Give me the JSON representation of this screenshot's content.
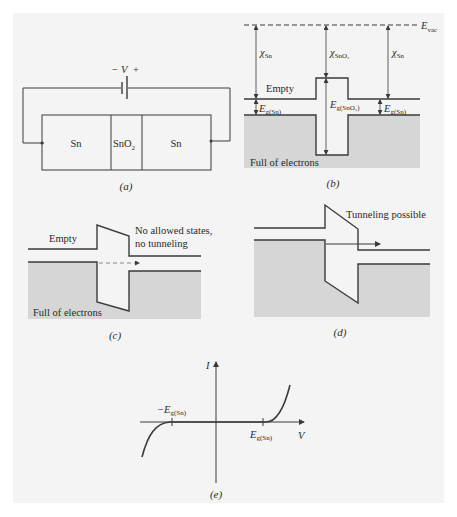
{
  "colors": {
    "background": "#ffffff",
    "panel": "#f4f4f4",
    "line": "#3a3a3a",
    "filled_band": "#d6d6d6"
  },
  "panel_a": {
    "caption": "(a)",
    "battery_label_minus": "−",
    "battery_label_V": "V",
    "battery_label_plus": "+",
    "regions": [
      "Sn",
      "SnO",
      "Sn"
    ],
    "oxide_subscript": "2"
  },
  "panel_b": {
    "caption": "(b)",
    "evac_label": "E",
    "evac_sub": "vac",
    "chi_left": "χ",
    "chi_left_sub": "Sn",
    "chi_mid": "χ",
    "chi_mid_sub": "SnO₂",
    "chi_right": "χ",
    "chi_right_sub": "Sn",
    "empty_label": "Empty",
    "full_label": "Full of electrons",
    "eg_left": "E",
    "eg_left_sub": "g(Sn)",
    "eg_mid": "E",
    "eg_mid_sub": "g(SnO₂)",
    "eg_right": "E",
    "eg_right_sub": "g(Sn)"
  },
  "panel_c": {
    "caption": "(c)",
    "empty_label": "Empty",
    "note_line1": "No allowed states,",
    "note_line2": "no tunneling",
    "full_label": "Full of electrons"
  },
  "panel_d": {
    "caption": "(d)",
    "note": "Tunneling possible"
  },
  "panel_e": {
    "caption": "(e)",
    "y_axis_label": "I",
    "x_axis_label": "V",
    "neg_tick_label": "−E",
    "neg_tick_sub": "g(Sn)",
    "pos_tick_label": "E",
    "pos_tick_sub": "g(Sn)"
  }
}
